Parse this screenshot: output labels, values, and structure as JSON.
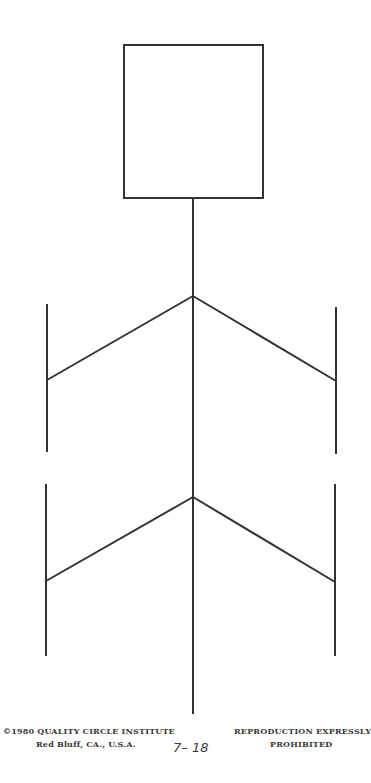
{
  "diagram": {
    "type": "fishbone-cause-and-effect",
    "line_color": "#333333",
    "effect_box": {
      "x": 124,
      "y": 45,
      "width": 139,
      "height": 153,
      "label": ""
    },
    "spine": {
      "x": 193,
      "y1": 198,
      "y2": 713
    },
    "upper_junction": {
      "x": 193,
      "y": 296
    },
    "lower_junction": {
      "x": 193,
      "y": 497
    },
    "branches": [
      {
        "name": "upper-left",
        "vertical": {
          "x": 47,
          "y1": 305,
          "y2": 451
        },
        "join_y": 380,
        "junction_y": 296
      },
      {
        "name": "upper-right",
        "vertical": {
          "x": 336,
          "y1": 308,
          "y2": 453
        },
        "join_y": 381,
        "junction_y": 296
      },
      {
        "name": "lower-left",
        "vertical": {
          "x": 46,
          "y1": 485,
          "y2": 655
        },
        "join_y": 581,
        "junction_y": 497
      },
      {
        "name": "lower-right",
        "vertical": {
          "x": 335,
          "y1": 485,
          "y2": 655
        },
        "join_y": 582,
        "junction_y": 497
      }
    ]
  },
  "footer": {
    "copyright": "©1980  QUALITY CIRCLE INSTITUTE",
    "location": "Red Bluff, CA., U.S.A.",
    "page_number": "7– 18",
    "notice_line_1": "REPRODUCTION EXPRESSLY",
    "notice_line_2": "PROHIBITED"
  }
}
